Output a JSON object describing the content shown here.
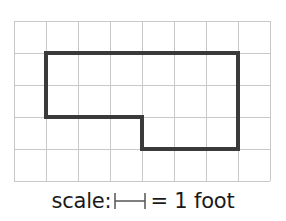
{
  "grid": {
    "columns": 8,
    "rows": 5,
    "cell_size_px": 32,
    "origin_px": [
      14,
      21
    ],
    "line_color": "#c8c8c8"
  },
  "shape": {
    "description": "L-shaped floor outline on grid",
    "stroke_color": "#3a3a3a",
    "vertices_grid_units": [
      [
        1,
        1
      ],
      [
        7,
        1
      ],
      [
        7,
        4
      ],
      [
        4,
        4
      ],
      [
        4,
        3
      ],
      [
        1,
        3
      ]
    ]
  },
  "caption": {
    "prefix": "scale:",
    "equals": "= 1 foot",
    "scale_bar_icon": "scale-bar-icon",
    "scale_bar_color": "#555555"
  }
}
